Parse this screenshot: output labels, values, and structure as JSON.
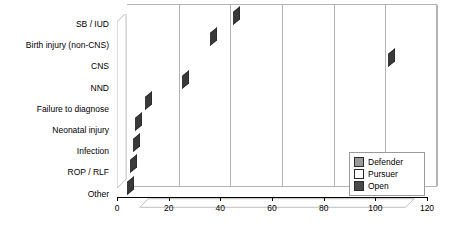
{
  "chart_data": {
    "type": "bar",
    "orientation": "horizontal",
    "stacked": true,
    "title": "",
    "xlabel": "",
    "ylabel": "",
    "xlim": [
      0,
      120
    ],
    "xticks": [
      0,
      20,
      40,
      60,
      80,
      100,
      120
    ],
    "xtick_labels": [
      "0",
      "20",
      "40",
      "60",
      "80",
      "100",
      "120"
    ],
    "grid": true,
    "legend_position": "bottom-right",
    "categories": [
      "SB / IUD",
      "Birth injury (non-CNS)",
      "CNS",
      "NND",
      "Failure to diagnose",
      "Neonatal injury",
      "Infection",
      "ROP / RLF",
      "Other"
    ],
    "series": [
      {
        "name": "Defender",
        "color": "#999999",
        "values": [
          29,
          30,
          62,
          14,
          8,
          4,
          4,
          3,
          2
        ]
      },
      {
        "name": "Pursuer",
        "color": "#ffffff",
        "values": [
          10,
          2,
          17,
          7,
          0,
          1,
          0,
          0,
          0
        ]
      },
      {
        "name": "Open",
        "color": "#4a4a4a",
        "values": [
          6,
          4,
          26,
          4,
          3,
          2,
          2,
          2,
          2
        ]
      }
    ],
    "totals": [
      45,
      36,
      105,
      25,
      11,
      7,
      6,
      5,
      4
    ]
  },
  "legend": {
    "items": [
      {
        "label": "Defender",
        "color": "#999999"
      },
      {
        "label": "Pursuer",
        "color": "#ffffff"
      },
      {
        "label": "Open",
        "color": "#4a4a4a"
      }
    ]
  },
  "colors": {
    "defender": "#999999",
    "pursuer": "#ffffff",
    "open": "#4a4a4a",
    "gridline": "#b4b4b4",
    "axis": "#000000",
    "floor": "#ffffff",
    "background": "#ffffff"
  }
}
